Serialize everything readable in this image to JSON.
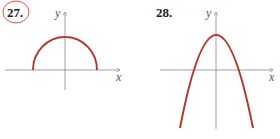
{
  "problems": [
    {
      "number": "27.",
      "circled": true,
      "axis_labels": {
        "x": "x",
        "y": "y"
      },
      "curve": "upper semicircle centered at origin"
    },
    {
      "number": "28.",
      "circled": false,
      "axis_labels": {
        "x": "x",
        "y": "y"
      },
      "curve": "downward-opening parabola with vertex on positive y-axis"
    }
  ],
  "colors": {
    "curve": "#b03a2e",
    "axis": "#888888",
    "circle_mark": "#d9534f",
    "text": "#222222"
  }
}
